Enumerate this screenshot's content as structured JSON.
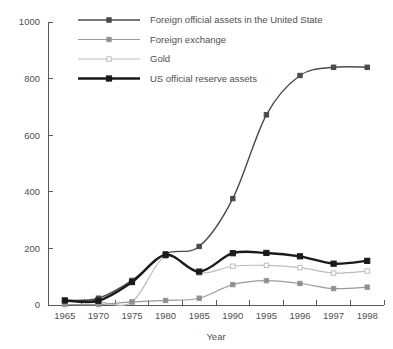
{
  "chart_data": {
    "type": "line",
    "title": "",
    "xlabel": "Year",
    "ylabel": "",
    "categories": [
      "1965",
      "1970",
      "1975",
      "1980",
      "1985",
      "1990",
      "1995",
      "1996",
      "1997",
      "1998"
    ],
    "x": [
      1965,
      1970,
      1975,
      1980,
      1985,
      1990,
      1995,
      1996,
      1997,
      1998
    ],
    "ylim": [
      0,
      1000
    ],
    "yticks": [
      0,
      200,
      400,
      600,
      800,
      1000
    ],
    "ytick_labels": [
      "0",
      "200",
      "400",
      "600",
      "800",
      "1000"
    ],
    "grid": false,
    "legend_position": "top-center",
    "series": [
      {
        "name": "Foreign official assets in the United State",
        "color": "#4a4a4a",
        "marker": "filled-square",
        "marker_fill": "#4a4a4a",
        "line_width": 1.4,
        "values": [
          16,
          24,
          87,
          181,
          207,
          376,
          672,
          811,
          840,
          840
        ]
      },
      {
        "name": "Foreign exchange",
        "color": "#9a9a9a",
        "marker": "filled-square",
        "marker_fill": "#8d8d8d",
        "line_width": 1.2,
        "values": [
          2,
          2,
          11,
          16,
          24,
          72,
          86,
          76,
          58,
          63
        ]
      },
      {
        "name": "Gold",
        "color": "#bcbcbc",
        "marker": "open-square",
        "marker_fill": "#ffffff",
        "line_width": 1.2,
        "values": [
          14,
          11,
          11,
          172,
          113,
          137,
          140,
          132,
          113,
          120
        ]
      },
      {
        "name": "US official reserve assets",
        "color": "#1a1a1a",
        "marker": "filled-square",
        "marker_fill": "#1a1a1a",
        "line_width": 2.4,
        "values": [
          16,
          15,
          81,
          177,
          118,
          183,
          184,
          172,
          146,
          156
        ]
      }
    ]
  },
  "legend": {
    "items": [
      {
        "label": "Foreign official assets in the United State"
      },
      {
        "label": "Foreign exchange"
      },
      {
        "label": "Gold"
      },
      {
        "label": "US official reserve assets"
      }
    ]
  },
  "axes": {
    "x_title": "Year",
    "y_tick_labels": [
      "1000",
      "800",
      "600",
      "400",
      "200",
      "0"
    ],
    "x_tick_labels": [
      "1965",
      "1970",
      "1975",
      "1980",
      "1985",
      "1990",
      "1995",
      "1996",
      "1997",
      "1998"
    ]
  }
}
